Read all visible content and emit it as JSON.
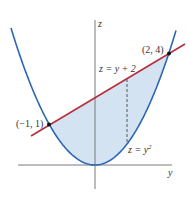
{
  "figure": {
    "axes": {
      "horizontal_label": "y",
      "vertical_label": "z"
    },
    "curves": {
      "parabola": {
        "equation": "z = y",
        "exponent": "2",
        "label_prefix": "z = y"
      },
      "line": {
        "equation": "z = y + 2"
      }
    },
    "points": [
      {
        "label": "(−1, 1)",
        "y": -1,
        "z": 1
      },
      {
        "label": "(2, 4)",
        "y": 2,
        "z": 4
      }
    ],
    "colors": {
      "parabola": "#2e66b4",
      "line": "#b4313c",
      "region": "#d3e3f2",
      "axes": "#7a7a7a",
      "points": "#111111"
    }
  }
}
